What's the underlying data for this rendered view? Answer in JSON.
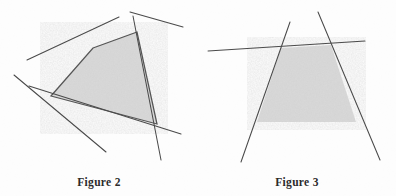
{
  "page": {
    "background_color": "#fdfdfd",
    "width": 396,
    "height": 196
  },
  "style": {
    "line_color": "#4a4a4a",
    "shade_fill": "#d9d9d9",
    "shade_edge": "#555555",
    "caption_color": "#2b2b2b"
  },
  "figures": [
    {
      "id": "figure-2",
      "caption": "Figure 2",
      "shape_type": "shaded convex quadrilateral",
      "polygon_points": "93,48 137,32 157,124 51,96",
      "lines": [
        {
          "name": "line-upper-left",
          "x1": 27,
          "y1": 60,
          "x2": 119,
          "y2": 17
        },
        {
          "name": "line-upper-right",
          "x1": 130,
          "y1": 12,
          "x2": 183,
          "y2": 27
        },
        {
          "name": "line-left-diagonal",
          "x1": 14,
          "y1": 75,
          "x2": 106,
          "y2": 152
        },
        {
          "name": "line-bottom",
          "x1": 29,
          "y1": 86,
          "x2": 181,
          "y2": 134
        },
        {
          "name": "line-right-vertical",
          "x1": 133,
          "y1": 16,
          "x2": 161,
          "y2": 160
        }
      ]
    },
    {
      "id": "figure-3",
      "caption": "Figure 3",
      "shape_type": "shaded trapezoid open at the base",
      "polygon_points": "83,48 133,45 158,122 59,122",
      "lines": [
        {
          "name": "line-left-side",
          "x1": 92,
          "y1": 22,
          "x2": 43,
          "y2": 162
        },
        {
          "name": "line-right-side",
          "x1": 120,
          "y1": 12,
          "x2": 182,
          "y2": 160
        },
        {
          "name": "line-horizontal-top",
          "x1": 10,
          "y1": 51,
          "x2": 167,
          "y2": 41
        }
      ]
    }
  ]
}
